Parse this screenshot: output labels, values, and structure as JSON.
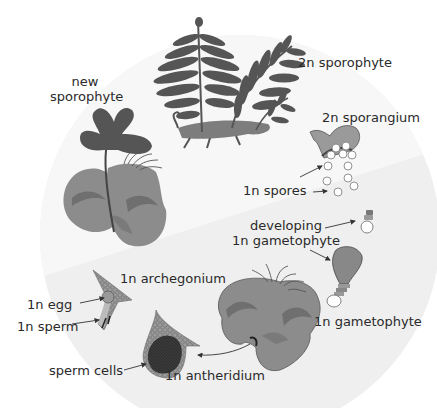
{
  "colors": {
    "circle_haploid": "#efefef",
    "circle_diploid": "#f6f6f6",
    "frond": "#555555",
    "thallus": "#8c8c8c",
    "thallus_dark": "#6f6f6f",
    "sporangium": "#9a9a9a",
    "text": "#2a2a2a"
  },
  "labels": {
    "sporophyte_2n": "2n sporophyte",
    "new_sporophyte_line1": "new",
    "new_sporophyte_line2": "sporophyte",
    "sporangium_2n": "2n sporangium",
    "spores_1n": "1n spores",
    "developing_line1": "developing",
    "developing_line2": "1n gametophyte",
    "gametophyte_1n": "1n gametophyte",
    "archegonium_1n": "1n archegonium",
    "egg_1n": "1n egg",
    "sperm_1n": "1n sperm",
    "sperm_cells": "sperm cells",
    "antheridium_1n": "1n antheridium"
  }
}
